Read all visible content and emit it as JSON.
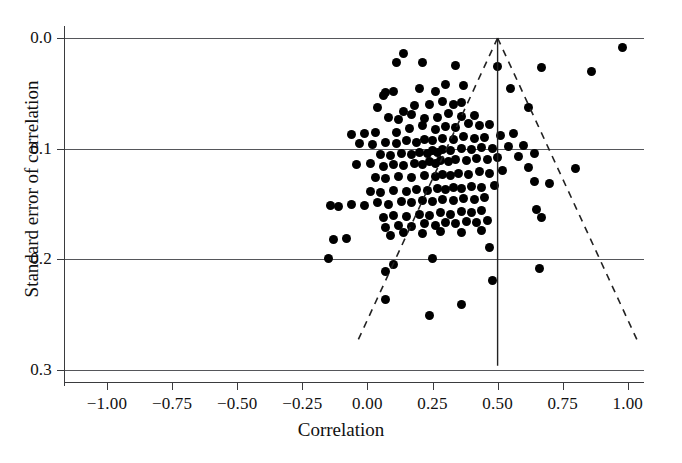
{
  "chart_data": {
    "type": "scatter",
    "title": "",
    "subtitle": "",
    "xlabel": "Correlation",
    "ylabel": "Standard error of correlation",
    "xlim": [
      -1.09,
      1.09
    ],
    "ylim": [
      0.0,
      0.3
    ],
    "y_axis_inverted": true,
    "grid": "horizontal-only",
    "legend": "none",
    "xticks": [
      -1.0,
      -0.75,
      -0.5,
      -0.25,
      0.0,
      0.25,
      0.5,
      0.75,
      1.0
    ],
    "xticklabels": [
      "−1.00",
      "−0.75",
      "−0.50",
      "−0.25",
      "0.00",
      "0.25",
      "0.50",
      "0.75",
      "1.00"
    ],
    "yticks": [
      0.0,
      0.1,
      0.2,
      0.3
    ],
    "yticklabels": [
      "0.0",
      "0.1",
      "0.2",
      "0.3"
    ],
    "gridlines_y": [
      0.0,
      0.1,
      0.2,
      0.3
    ],
    "marker": {
      "shape": "circle",
      "color": "#000000",
      "size_px": 9
    },
    "annotations": {
      "vertical_reference_line": {
        "x": 0.5,
        "y_from": 0.0,
        "y_to": 0.296,
        "style": "solid",
        "color": "#222222"
      },
      "funnel_left_edge": {
        "from": [
          0.5,
          0.0
        ],
        "to": [
          -0.04,
          0.275
        ],
        "style": "dashed",
        "color": "#222222"
      },
      "funnel_right_edge": {
        "from": [
          0.5,
          0.0
        ],
        "to": [
          1.04,
          0.275
        ],
        "style": "dashed",
        "color": "#222222"
      }
    },
    "points": [
      [
        0.98,
        0.009
      ],
      [
        0.86,
        0.03
      ],
      [
        0.67,
        0.027
      ],
      [
        0.5,
        0.026
      ],
      [
        0.34,
        0.025
      ],
      [
        0.21,
        0.022
      ],
      [
        0.14,
        0.014
      ],
      [
        0.11,
        0.022
      ],
      [
        0.55,
        0.046
      ],
      [
        0.37,
        0.043
      ],
      [
        0.3,
        0.042
      ],
      [
        0.26,
        0.048
      ],
      [
        0.2,
        0.046
      ],
      [
        0.1,
        0.048
      ],
      [
        0.07,
        0.049
      ],
      [
        0.06,
        0.052
      ],
      [
        0.36,
        0.058
      ],
      [
        0.33,
        0.06
      ],
      [
        0.29,
        0.057
      ],
      [
        0.24,
        0.06
      ],
      [
        0.62,
        0.063
      ],
      [
        0.18,
        0.061
      ],
      [
        0.14,
        0.066
      ],
      [
        0.04,
        0.063
      ],
      [
        0.41,
        0.07
      ],
      [
        0.36,
        0.071
      ],
      [
        0.31,
        0.068
      ],
      [
        0.27,
        0.072
      ],
      [
        0.22,
        0.073
      ],
      [
        0.17,
        0.069
      ],
      [
        0.12,
        0.074
      ],
      [
        0.08,
        0.072
      ],
      [
        0.47,
        0.078
      ],
      [
        0.43,
        0.079
      ],
      [
        0.39,
        0.077
      ],
      [
        0.34,
        0.081
      ],
      [
        0.3,
        0.08
      ],
      [
        0.26,
        0.083
      ],
      [
        0.21,
        0.079
      ],
      [
        0.16,
        0.082
      ],
      [
        0.11,
        0.085
      ],
      [
        0.03,
        0.085
      ],
      [
        -0.01,
        0.086
      ],
      [
        -0.06,
        0.087
      ],
      [
        0.56,
        0.086
      ],
      [
        0.51,
        0.088
      ],
      [
        0.45,
        0.09
      ],
      [
        0.41,
        0.091
      ],
      [
        0.37,
        0.089
      ],
      [
        0.33,
        0.092
      ],
      [
        0.29,
        0.091
      ],
      [
        0.25,
        0.093
      ],
      [
        0.22,
        0.092
      ],
      [
        0.19,
        0.094
      ],
      [
        0.15,
        0.093
      ],
      [
        0.11,
        0.095
      ],
      [
        0.07,
        0.094
      ],
      [
        0.02,
        0.096
      ],
      [
        -0.03,
        0.095
      ],
      [
        0.6,
        0.097
      ],
      [
        0.54,
        0.098
      ],
      [
        0.48,
        0.1
      ],
      [
        0.44,
        0.099
      ],
      [
        0.4,
        0.101
      ],
      [
        0.36,
        0.1
      ],
      [
        0.32,
        0.102
      ],
      [
        0.29,
        0.101
      ],
      [
        0.27,
        0.103
      ],
      [
        0.25,
        0.102
      ],
      [
        0.23,
        0.104
      ],
      [
        0.2,
        0.103
      ],
      [
        0.17,
        0.105
      ],
      [
        0.13,
        0.104
      ],
      [
        0.09,
        0.106
      ],
      [
        0.05,
        0.105
      ],
      [
        0.64,
        0.104
      ],
      [
        0.58,
        0.107
      ],
      [
        0.5,
        0.108
      ],
      [
        0.46,
        0.11
      ],
      [
        0.42,
        0.109
      ],
      [
        0.38,
        0.111
      ],
      [
        0.34,
        0.11
      ],
      [
        0.31,
        0.112
      ],
      [
        0.28,
        0.111
      ],
      [
        0.26,
        0.113
      ],
      [
        0.24,
        0.112
      ],
      [
        0.21,
        0.114
      ],
      [
        0.18,
        0.113
      ],
      [
        0.14,
        0.115
      ],
      [
        0.1,
        0.114
      ],
      [
        0.06,
        0.116
      ],
      [
        0.01,
        0.113
      ],
      [
        -0.04,
        0.114
      ],
      [
        0.8,
        0.118
      ],
      [
        0.62,
        0.117
      ],
      [
        0.52,
        0.12
      ],
      [
        0.47,
        0.122
      ],
      [
        0.43,
        0.121
      ],
      [
        0.39,
        0.123
      ],
      [
        0.35,
        0.122
      ],
      [
        0.32,
        0.124
      ],
      [
        0.29,
        0.123
      ],
      [
        0.26,
        0.125
      ],
      [
        0.22,
        0.124
      ],
      [
        0.17,
        0.126
      ],
      [
        0.12,
        0.125
      ],
      [
        0.07,
        0.127
      ],
      [
        0.03,
        0.126
      ],
      [
        0.7,
        0.131
      ],
      [
        0.64,
        0.13
      ],
      [
        0.49,
        0.133
      ],
      [
        0.44,
        0.135
      ],
      [
        0.4,
        0.134
      ],
      [
        0.36,
        0.136
      ],
      [
        0.33,
        0.135
      ],
      [
        0.3,
        0.137
      ],
      [
        0.27,
        0.136
      ],
      [
        0.23,
        0.138
      ],
      [
        0.19,
        0.137
      ],
      [
        0.15,
        0.139
      ],
      [
        0.1,
        0.138
      ],
      [
        0.05,
        0.14
      ],
      [
        0.01,
        0.139
      ],
      [
        0.45,
        0.144
      ],
      [
        0.41,
        0.146
      ],
      [
        0.37,
        0.145
      ],
      [
        0.33,
        0.147
      ],
      [
        0.29,
        0.146
      ],
      [
        0.25,
        0.148
      ],
      [
        0.21,
        0.147
      ],
      [
        0.17,
        0.149
      ],
      [
        0.13,
        0.148
      ],
      [
        0.08,
        0.15
      ],
      [
        0.04,
        0.149
      ],
      [
        -0.01,
        0.151
      ],
      [
        -0.06,
        0.15
      ],
      [
        -0.11,
        0.152
      ],
      [
        -0.14,
        0.151
      ],
      [
        0.65,
        0.155
      ],
      [
        0.44,
        0.156
      ],
      [
        0.4,
        0.158
      ],
      [
        0.36,
        0.157
      ],
      [
        0.32,
        0.159
      ],
      [
        0.28,
        0.158
      ],
      [
        0.24,
        0.16
      ],
      [
        0.2,
        0.159
      ],
      [
        0.15,
        0.161
      ],
      [
        0.1,
        0.16
      ],
      [
        0.06,
        0.162
      ],
      [
        0.67,
        0.162
      ],
      [
        0.46,
        0.165
      ],
      [
        0.42,
        0.167
      ],
      [
        0.38,
        0.166
      ],
      [
        0.34,
        0.168
      ],
      [
        0.3,
        0.167
      ],
      [
        0.26,
        0.169
      ],
      [
        0.22,
        0.168
      ],
      [
        0.17,
        0.17
      ],
      [
        0.12,
        0.169
      ],
      [
        0.07,
        0.171
      ],
      [
        0.44,
        0.174
      ],
      [
        0.36,
        0.176
      ],
      [
        0.28,
        0.175
      ],
      [
        0.21,
        0.177
      ],
      [
        0.14,
        0.176
      ],
      [
        0.09,
        0.178
      ],
      [
        -0.08,
        0.181
      ],
      [
        -0.13,
        0.182
      ],
      [
        0.47,
        0.189
      ],
      [
        0.25,
        0.199
      ],
      [
        -0.15,
        0.199
      ],
      [
        0.66,
        0.208
      ],
      [
        0.1,
        0.205
      ],
      [
        0.07,
        0.211
      ],
      [
        0.48,
        0.219
      ],
      [
        0.07,
        0.236
      ],
      [
        0.36,
        0.241
      ],
      [
        0.24,
        0.251
      ]
    ]
  }
}
